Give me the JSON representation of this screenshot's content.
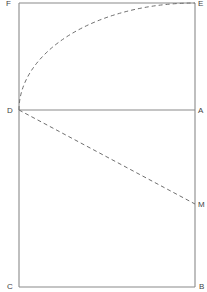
{
  "diagram": {
    "type": "geometric construction",
    "points": {
      "F": {
        "label": "F",
        "x": 19,
        "y": 3
      },
      "E": {
        "label": "E",
        "x": 195,
        "y": 3
      },
      "D": {
        "label": "D",
        "x": 19,
        "y": 110
      },
      "A": {
        "label": "A",
        "x": 195,
        "y": 110
      },
      "M": {
        "label": "M",
        "x": 195,
        "y": 204
      },
      "C": {
        "label": "C",
        "x": 19,
        "y": 287
      },
      "B": {
        "label": "B",
        "x": 195,
        "y": 287
      }
    },
    "solid_lines": [
      {
        "from": "F",
        "to": "E"
      },
      {
        "from": "E",
        "to": "B"
      },
      {
        "from": "F",
        "to": "C"
      },
      {
        "from": "C",
        "to": "B"
      },
      {
        "from": "D",
        "to": "A"
      }
    ],
    "dashed_lines": [
      {
        "from": "D",
        "to": "M"
      }
    ],
    "dashed_arcs": [
      {
        "from": "D",
        "to": "E",
        "center": "A"
      }
    ],
    "colors": {
      "line": "#8a8a8a",
      "dash": "#6f6f6f",
      "text": "#444444",
      "background": "#ffffff"
    }
  }
}
